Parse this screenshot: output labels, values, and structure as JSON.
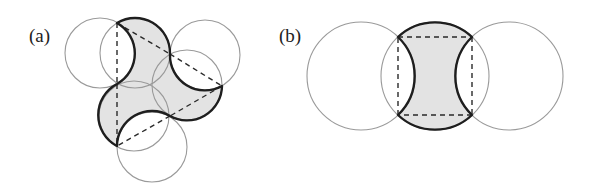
{
  "figure": {
    "colors": {
      "background": "#ffffff",
      "fill": "#e3e3e3",
      "thin_circle": "#9a9a9a",
      "thick_arc": "#1e1e1e",
      "dashed_line": "#2a2a2a"
    },
    "panels": [
      {
        "id": "a",
        "label": "(a)",
        "label_pos": [
          29,
          26
        ],
        "description": "Three-lobed shaded region bounded by alternating convex and concave circular arcs on a dashed triangle",
        "vertices": {
          "A": [
            117,
            23
          ],
          "B": [
            170,
            54
          ],
          "C": [
            222,
            86
          ],
          "D": [
            170,
            116
          ],
          "E": [
            117,
            146
          ],
          "F": [
            117,
            84
          ]
        },
        "circles": [
          {
            "name": "outer-upper-left",
            "cx": 100,
            "cy": 53,
            "r": 35
          },
          {
            "name": "outer-upper-right",
            "cx": 205,
            "cy": 55,
            "r": 35
          },
          {
            "name": "outer-bottom",
            "cx": 152,
            "cy": 147,
            "r": 35
          },
          {
            "name": "inner-top",
            "cx": 135,
            "cy": 53,
            "r": 35
          },
          {
            "name": "inner-right",
            "cx": 187,
            "cy": 85,
            "r": 35
          },
          {
            "name": "inner-left",
            "cx": 134,
            "cy": 116,
            "r": 35
          }
        ],
        "boundary_path": "M117,23 A35,35 0 0 1 170,54 A35,35 0 0 0 222,86 A35,35 0 0 1 170,116 A35,35 0 0 0 117,146 A35,35 0 0 1 117,84 A35,35 0 0 0 117,23 Z",
        "dashed_segments": [
          [
            117,
            23,
            117,
            84
          ],
          [
            117,
            84,
            117,
            146
          ],
          [
            117,
            23,
            170,
            54
          ],
          [
            170,
            54,
            222,
            86
          ],
          [
            222,
            86,
            170,
            116
          ],
          [
            170,
            116,
            117,
            146
          ]
        ]
      },
      {
        "id": "b",
        "label": "(b)",
        "label_pos": [
          279,
          26
        ],
        "description": "Shaded region bounded by two convex arcs (top/bottom) and two concave arcs (left/right) over a dashed rectangle",
        "vertices": {
          "P1": [
            398,
            37
          ],
          "P2": [
            472,
            37
          ],
          "P3": [
            472,
            115
          ],
          "P4": [
            398,
            115
          ]
        },
        "circles": [
          {
            "name": "left",
            "cx": 361,
            "cy": 76,
            "r": 54
          },
          {
            "name": "center",
            "cx": 435,
            "cy": 76,
            "r": 54
          },
          {
            "name": "right",
            "cx": 509,
            "cy": 76,
            "r": 54
          }
        ],
        "boundary_path": "M398,37 A54,54 0 0 1 472,37 A54,54 0 0 0 472,115 A54,54 0 0 1 398,115 A54,54 0 0 0 398,37 Z",
        "dashed_segments": [
          [
            398,
            37,
            472,
            37
          ],
          [
            472,
            37,
            472,
            115
          ],
          [
            472,
            115,
            398,
            115
          ],
          [
            398,
            115,
            398,
            37
          ]
        ]
      }
    ]
  }
}
